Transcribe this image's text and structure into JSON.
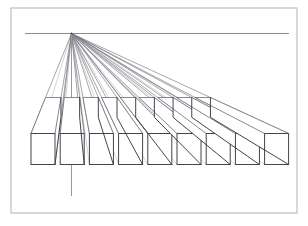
{
  "figure": {
    "kind": "line-drawing",
    "background_color": "#ffffff",
    "frame": {
      "x": 11,
      "y": 8,
      "width": 286,
      "height": 205,
      "stroke_color": "#b9b9b9",
      "stroke_width": 1.1
    },
    "canvas": {
      "width": 308,
      "height": 226
    }
  },
  "horizon": {
    "label": "horizon-line",
    "y": 33.5,
    "x_start": 25,
    "x_end": 289,
    "stroke_color": "#8c8c8c"
  },
  "vanishing_point": {
    "label": "vanishing-point",
    "x": 71.5,
    "y": 33.5,
    "marker_radius": 1.1,
    "color": "#4a4a52"
  },
  "plumb_line": {
    "label": "vertical-construction-line",
    "x": 71.5,
    "y_start": 33.5,
    "y_end": 196,
    "stroke_color": "#9a9a9a"
  },
  "cube_row": {
    "label": "row-of-cubes",
    "count": 9,
    "front_face_top_y": 133.5,
    "front_face_bottom_y": 164.5,
    "front_face_size": 31,
    "first_cube_left_x": 31,
    "spacing_x": 29.2,
    "depth_factor": 0.36,
    "stroke_color": "#3a3a44",
    "cubes": [
      {
        "index": 1,
        "left_x": 31.0,
        "right_x": 55.0
      },
      {
        "index": 2,
        "left_x": 60.2,
        "right_x": 84.2
      },
      {
        "index": 3,
        "left_x": 89.4,
        "right_x": 113.4
      },
      {
        "index": 4,
        "left_x": 118.6,
        "right_x": 142.6
      },
      {
        "index": 5,
        "left_x": 147.8,
        "right_x": 171.8
      },
      {
        "index": 6,
        "left_x": 177.0,
        "right_x": 201.0
      },
      {
        "index": 7,
        "left_x": 206.2,
        "right_x": 230.2
      },
      {
        "index": 8,
        "left_x": 235.4,
        "right_x": 259.4
      },
      {
        "index": 9,
        "left_x": 264.6,
        "right_x": 288.6
      }
    ]
  },
  "construction_rays": {
    "label": "perspective-rays",
    "description": "Lines converging from each cube corner to the vanishing point",
    "stroke_color": "#6e6e78",
    "count": 20
  },
  "chart_data": {
    "type": "scatter",
    "xlabel": "",
    "ylabel": "",
    "xlim": [
      11,
      297
    ],
    "ylim": [
      8,
      213
    ],
    "grid": false,
    "legend": "none",
    "annotations": [
      "horizon line at y = 33.5",
      "vanishing point at (71.5, 33.5)",
      "nine equal cubes on a common ground line",
      "vertical plumb line dropped from vanishing point"
    ],
    "categories": [
      "cube 1",
      "cube 2",
      "cube 3",
      "cube 4",
      "cube 5",
      "cube 6",
      "cube 7",
      "cube 8",
      "cube 9"
    ],
    "values": [
      31.0,
      60.2,
      89.4,
      118.6,
      147.8,
      177.0,
      206.2,
      235.4,
      264.6
    ]
  }
}
